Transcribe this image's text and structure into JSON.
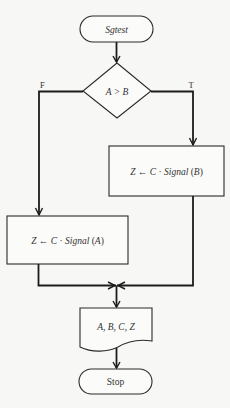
{
  "diagram": {
    "type": "flowchart",
    "nodes": {
      "start": {
        "kind": "terminal",
        "label": "Sgtest"
      },
      "decision": {
        "kind": "decision",
        "label": "A > B"
      },
      "process_true": {
        "kind": "process",
        "label": "Z ← C · Signal (B)"
      },
      "process_false": {
        "kind": "process",
        "label": "Z ← C · Signal (A)"
      },
      "output": {
        "kind": "document",
        "label": "A, B, C, Z"
      },
      "stop": {
        "kind": "terminal",
        "label": "Stop"
      }
    },
    "branches": {
      "true_label": "T",
      "false_label": "F"
    },
    "edges": [
      {
        "from": "start",
        "to": "decision"
      },
      {
        "from": "decision",
        "to": "process_true",
        "label": "T"
      },
      {
        "from": "decision",
        "to": "process_false",
        "label": "F"
      },
      {
        "from": "process_true",
        "to": "output"
      },
      {
        "from": "process_false",
        "to": "output"
      },
      {
        "from": "output",
        "to": "stop"
      }
    ]
  }
}
